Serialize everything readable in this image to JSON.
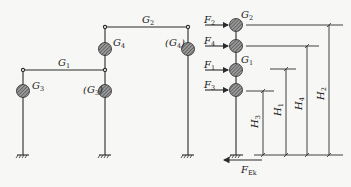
{
  "colors": {
    "line": "#2a2a2a",
    "mass_fill": "#7a7a7a",
    "background": "#f7f7f5"
  },
  "left_frame": {
    "beams": [
      {
        "id": "G1",
        "label": "G",
        "sub": "1"
      },
      {
        "id": "G2",
        "label": "G",
        "sub": "2"
      }
    ],
    "masses": [
      {
        "id": "G3",
        "label": "G",
        "sub": "3",
        "paren": false
      },
      {
        "id": "G3p",
        "label": "(G",
        "sub": "3",
        "close": ")",
        "paren": true
      },
      {
        "id": "G4",
        "label": "G",
        "sub": "4",
        "paren": false
      },
      {
        "id": "G4p",
        "label": "(G",
        "sub": "4",
        "close": ")",
        "paren": true
      }
    ]
  },
  "right_model": {
    "forces": [
      {
        "label": "F",
        "sub": "2"
      },
      {
        "label": "F",
        "sub": "4"
      },
      {
        "label": "F",
        "sub": "1"
      },
      {
        "label": "F",
        "sub": "3"
      }
    ],
    "mass_labels": [
      {
        "label": "G",
        "sub": "2"
      },
      {
        "label": "G",
        "sub": "1"
      }
    ],
    "heights": [
      {
        "label": "H",
        "sub": "3"
      },
      {
        "label": "H",
        "sub": "1"
      },
      {
        "label": "H",
        "sub": "4"
      },
      {
        "label": "H",
        "sub": "2"
      }
    ],
    "base_shear": {
      "label": "F",
      "sub": "Ek"
    }
  }
}
